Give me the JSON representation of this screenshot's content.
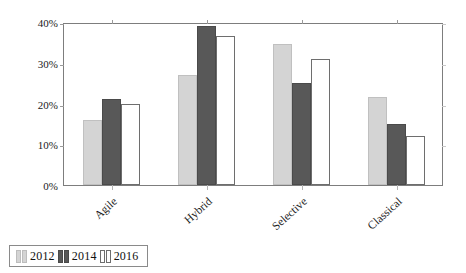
{
  "chart_data": {
    "type": "bar",
    "title": "",
    "xlabel": "",
    "ylabel": "Process model used",
    "categories": [
      "Agile",
      "Hybrid",
      "Selective",
      "Classical"
    ],
    "series": [
      {
        "name": "2012",
        "color": "#d4d4d4",
        "values": [
          16,
          27,
          34.5,
          21.5
        ]
      },
      {
        "name": "2014",
        "color": "#585858",
        "values": [
          21,
          39,
          25,
          15
        ]
      },
      {
        "name": "2016",
        "color": "#ffffff",
        "values": [
          20,
          36.5,
          31,
          12
        ]
      }
    ],
    "ylim": [
      0,
      40
    ],
    "yticks": [
      0,
      10,
      20,
      30,
      40
    ],
    "ytick_labels": [
      "0%",
      "10%",
      "20%",
      "30%",
      "40%"
    ],
    "grid": false,
    "legend_position": "below-left",
    "legend_entries": [
      "2012",
      "2014",
      "2016"
    ]
  }
}
